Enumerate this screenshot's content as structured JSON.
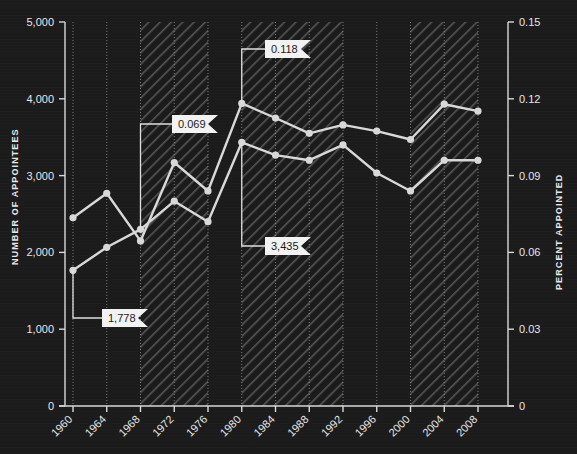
{
  "chart_data": {
    "type": "line",
    "title": "",
    "xlabel": "",
    "ylabel": "NUMBER OF APPOINTEES",
    "y2label": "PERCENT APPOINTED",
    "grid": true,
    "legend_position": "none",
    "x": [
      1960,
      1964,
      1968,
      1972,
      1976,
      1980,
      1984,
      1988,
      1992,
      1996,
      2000,
      2004,
      2008
    ],
    "xtick_labels": [
      "1960",
      "1964",
      "1968",
      "1972",
      "1976",
      "1980",
      "1984",
      "1988",
      "1992",
      "1996",
      "2000",
      "2004",
      "2008"
    ],
    "ylim": [
      0,
      5000
    ],
    "ytick_labels": [
      "0",
      "1,000",
      "2,000",
      "3,000",
      "4,000",
      "5,000"
    ],
    "ytick_values": [
      0,
      1000,
      2000,
      3000,
      4000,
      5000
    ],
    "y2lim": [
      0,
      0.15
    ],
    "y2tick_labels": [
      "0",
      "0.03",
      "0.06",
      "0.09",
      "0.12",
      "0.15"
    ],
    "y2tick_values": [
      0,
      0.03,
      0.06,
      0.09,
      0.12,
      0.15
    ],
    "series": [
      {
        "name": "Number of appointees",
        "axis": "left",
        "values": [
          2450,
          2770,
          2150,
          3170,
          2800,
          3940,
          3750,
          3550,
          3660,
          3580,
          3470,
          3930,
          3840
        ]
      },
      {
        "name": "Percent appointed",
        "axis": "right",
        "values": [
          0.053,
          0.062,
          0.069,
          0.08,
          0.072,
          0.103,
          0.098,
          0.096,
          0.102,
          0.091,
          0.084,
          0.096,
          0.096
        ]
      }
    ],
    "shaded_bands": [
      {
        "from": 1968,
        "to": 1976
      },
      {
        "from": 1980,
        "to": 1992
      },
      {
        "from": 2000,
        "to": 2008
      }
    ],
    "annotations": [
      {
        "id": "a1",
        "label": "1,778",
        "target_x": 1960,
        "target_series": "Percent appointed"
      },
      {
        "id": "a2",
        "label": "0.069",
        "target_x": 1968,
        "target_series": "Percent appointed"
      },
      {
        "id": "a3",
        "label": "0.118",
        "target_x": 1980,
        "target_series": "Number of appointees"
      },
      {
        "id": "a4",
        "label": "3,435",
        "target_x": 1980,
        "target_series": "Percent appointed"
      }
    ],
    "colors": {
      "background": "#1b1b1b",
      "line": "#d8d8d8",
      "axis": "#d9d9d9",
      "text": "#e6e6e6",
      "callout_bg": "#f2f2f2",
      "callout_text": "#1b1b1b"
    }
  }
}
